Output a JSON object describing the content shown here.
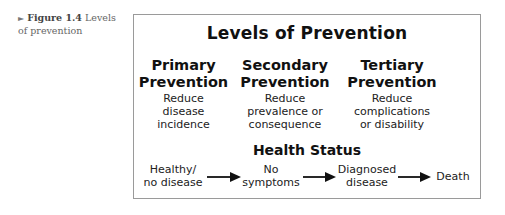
{
  "caption": {
    "marker": "►",
    "figure_label": "Figure 1.4",
    "text": "Levels of prevention"
  },
  "diagram": {
    "title": "Levels of Prevention",
    "levels": [
      {
        "heading_line1": "Primary",
        "heading_line2": "Prevention",
        "desc_lines": [
          "Reduce",
          "disease",
          "incidence"
        ]
      },
      {
        "heading_line1": "Secondary",
        "heading_line2": "Prevention",
        "desc_lines": [
          "Reduce",
          "prevalence or",
          "consequence"
        ]
      },
      {
        "heading_line1": "Tertiary",
        "heading_line2": "Prevention",
        "desc_lines": [
          "Reduce",
          "complications",
          "or disability"
        ]
      }
    ],
    "health_status": {
      "title": "Health Status",
      "stages": [
        {
          "line1": "Healthy/",
          "line2": "no disease"
        },
        {
          "line1": "No",
          "line2": "symptoms"
        },
        {
          "line1": "Diagnosed",
          "line2": "disease"
        },
        {
          "line1": "Death",
          "line2": ""
        }
      ],
      "arrow_icon": "right-arrow"
    },
    "colors": {
      "border": "#9a9a9a",
      "text": "#111111",
      "caption": "#666666"
    }
  }
}
